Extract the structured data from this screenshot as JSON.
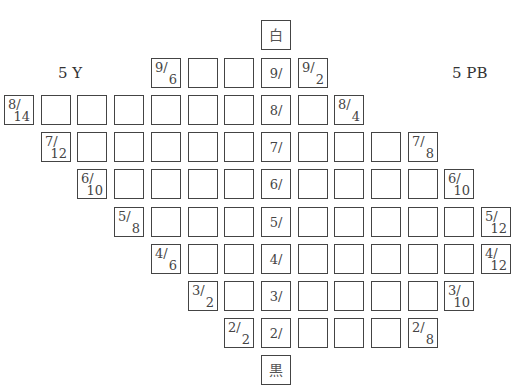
{
  "chart_data": {
    "type": "diagram",
    "title": "",
    "hue_labels": {
      "left": "5 Y",
      "right": "5 PB"
    },
    "neutral_axis": {
      "top": "白",
      "bottom": "黒",
      "values": [
        "9/",
        "8/",
        "7/",
        "6/",
        "5/",
        "4/",
        "3/",
        "2/"
      ]
    },
    "grid": {
      "pitch_x": 36.7,
      "origin_x": 4,
      "neutral_col": 7,
      "rows": [
        {
          "value": 9,
          "y": 58,
          "left_end": {
            "col": 4,
            "label": "9/6"
          },
          "right_end": {
            "col": 8,
            "label": "9/2"
          }
        },
        {
          "value": 8,
          "y": 95,
          "left_end": {
            "col": 0,
            "label": "8/14"
          },
          "right_end": {
            "col": 9,
            "label": "8/4"
          }
        },
        {
          "value": 7,
          "y": 132,
          "left_end": {
            "col": 1,
            "label": "7/12"
          },
          "right_end": {
            "col": 11,
            "label": "7/8"
          }
        },
        {
          "value": 6,
          "y": 169,
          "left_end": {
            "col": 2,
            "label": "6/10"
          },
          "right_end": {
            "col": 12,
            "label": "6/10"
          }
        },
        {
          "value": 5,
          "y": 207,
          "left_end": {
            "col": 3,
            "label": "5/8"
          },
          "right_end": {
            "col": 13,
            "label": "5/12"
          }
        },
        {
          "value": 4,
          "y": 244,
          "left_end": {
            "col": 4,
            "label": "4/6"
          },
          "right_end": {
            "col": 13,
            "label": "4/12"
          }
        },
        {
          "value": 3,
          "y": 281,
          "left_end": {
            "col": 5,
            "label": "3/2"
          },
          "right_end": {
            "col": 12,
            "label": "3/10"
          }
        },
        {
          "value": 2,
          "y": 318,
          "left_end": {
            "col": 6,
            "label": "2/2"
          },
          "right_end": {
            "col": 11,
            "label": "2/8"
          }
        }
      ],
      "white": {
        "col": 7,
        "y": 20,
        "label": "白"
      },
      "black": {
        "col": 7,
        "y": 355,
        "label": "黒"
      }
    }
  }
}
